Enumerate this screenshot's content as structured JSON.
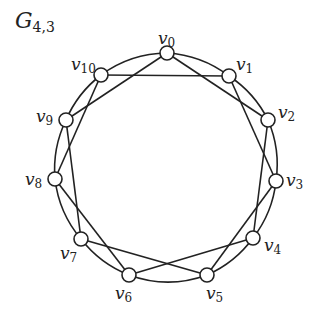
{
  "title": {
    "main": "G",
    "subscript": "4,3"
  },
  "graph": {
    "stroke_color": "#222222",
    "node_fill": "#ffffff",
    "node_radius": 7,
    "outer_cycle": {
      "cx": 166,
      "cy": 165,
      "r": 113
    },
    "vertices": [
      {
        "id": "v0",
        "name": "v",
        "sub": "0",
        "x": 167,
        "y": 53,
        "lx": 158,
        "ly": 30
      },
      {
        "id": "v1",
        "name": "v",
        "sub": "1",
        "x": 229,
        "y": 76,
        "lx": 236,
        "ly": 56
      },
      {
        "id": "v2",
        "name": "v",
        "sub": "2",
        "x": 268,
        "y": 120,
        "lx": 278,
        "ly": 104
      },
      {
        "id": "v3",
        "name": "v",
        "sub": "3",
        "x": 276,
        "y": 181,
        "lx": 286,
        "ly": 172
      },
      {
        "id": "v4",
        "name": "v",
        "sub": "4",
        "x": 253,
        "y": 238,
        "lx": 264,
        "ly": 237
      },
      {
        "id": "v5",
        "name": "v",
        "sub": "5",
        "x": 207,
        "y": 275,
        "lx": 206,
        "ly": 285
      },
      {
        "id": "v6",
        "name": "v",
        "sub": "6",
        "x": 129,
        "y": 275,
        "lx": 115,
        "ly": 285
      },
      {
        "id": "v7",
        "name": "v",
        "sub": "7",
        "x": 81,
        "y": 239,
        "lx": 60,
        "ly": 245
      },
      {
        "id": "v8",
        "name": "v",
        "sub": "8",
        "x": 55,
        "y": 179,
        "lx": 25,
        "ly": 171
      },
      {
        "id": "v9",
        "name": "v",
        "sub": "9",
        "x": 66,
        "y": 120,
        "lx": 36,
        "ly": 108
      },
      {
        "id": "v10",
        "name": "v",
        "sub": "10",
        "x": 101,
        "y": 75,
        "lx": 71,
        "ly": 56
      }
    ],
    "cycle_edges": [
      [
        0,
        1
      ],
      [
        1,
        2
      ],
      [
        2,
        3
      ],
      [
        3,
        4
      ],
      [
        4,
        5
      ],
      [
        5,
        6
      ],
      [
        6,
        7
      ],
      [
        7,
        8
      ],
      [
        8,
        9
      ],
      [
        9,
        10
      ],
      [
        10,
        0
      ]
    ],
    "chord_edges": [
      [
        0,
        2
      ],
      [
        1,
        3
      ],
      [
        2,
        4
      ],
      [
        3,
        5
      ],
      [
        4,
        6
      ],
      [
        5,
        7
      ],
      [
        6,
        8
      ],
      [
        7,
        9
      ],
      [
        8,
        10
      ],
      [
        9,
        0
      ],
      [
        10,
        1
      ]
    ]
  }
}
